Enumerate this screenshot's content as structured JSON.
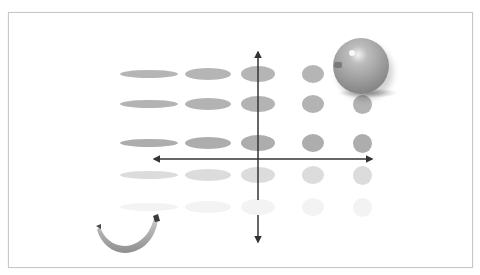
{
  "figure": {
    "colors": {
      "frame_border": "#c8c8c8",
      "axis": "#333333",
      "row_fills": [
        "#b5b5b5",
        "#b3b3b3",
        "#adadad",
        "#dcdcdc",
        "#f3f3f3"
      ]
    },
    "columns": [
      {
        "cx": 149,
        "w": 58
      },
      {
        "cx": 208,
        "w": 46
      },
      {
        "cx": 258,
        "w": 34
      },
      {
        "cx": 313,
        "w": 22
      },
      {
        "cx": 362,
        "w": 19
      }
    ],
    "rows": [
      {
        "cy": 74,
        "heights": [
          8,
          12,
          16,
          18,
          19
        ],
        "hidden_columns": [
          4
        ]
      },
      {
        "cy": 104,
        "heights": [
          8,
          12,
          16,
          18,
          19
        ],
        "hidden_columns": []
      },
      {
        "cy": 143,
        "heights": [
          8,
          12,
          16,
          18,
          19
        ],
        "hidden_columns": []
      },
      {
        "cy": 175,
        "heights": [
          8,
          12,
          16,
          18,
          19
        ],
        "hidden_columns": []
      },
      {
        "cy": 207,
        "heights": [
          8,
          12,
          16,
          18,
          19
        ],
        "hidden_columns": []
      }
    ],
    "axes": {
      "horizontal": {
        "y": 159,
        "x1": 154,
        "x2": 372,
        "arrows": "both"
      },
      "vertical": {
        "x": 258,
        "y1": 52,
        "y2": 242,
        "arrows": "both",
        "gap": [
          200,
          215
        ]
      }
    },
    "images": [
      {
        "name": "apple",
        "label": "apple-image"
      },
      {
        "name": "banana",
        "label": "banana-image"
      }
    ]
  }
}
